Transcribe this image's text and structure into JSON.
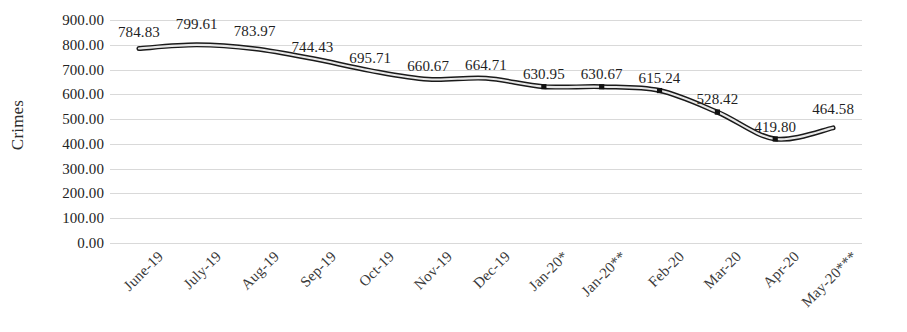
{
  "chart_data": {
    "type": "line",
    "title": "",
    "xlabel": "",
    "ylabel": "Crimes",
    "ylim": [
      0,
      900
    ],
    "ytick_step": 100,
    "grid": true,
    "legend": "none",
    "series_name": "Crimes",
    "line_color": "#595959",
    "line_outline_color": "#1a1a1a",
    "marker": "square",
    "smoothed": true,
    "categories": [
      "June-19",
      "July-19",
      "Aug-19",
      "Sep-19",
      "Oct-19",
      "Nov-19",
      "Dec-19",
      "Jan-20*",
      "Jan-20**",
      "Feb-20",
      "Mar-20",
      "Apr-20",
      "May-20***"
    ],
    "values": [
      784.83,
      799.61,
      783.97,
      744.43,
      695.71,
      660.67,
      664.71,
      630.95,
      630.67,
      615.24,
      528.42,
      419.8,
      464.58
    ],
    "data_labels": [
      "784.83",
      "799.61",
      "783.97",
      "744.43",
      "695.71",
      "660.67",
      "664.71",
      "630.95",
      "630.67",
      "615.24",
      "528.42",
      "419.80",
      "464.58"
    ],
    "ytick_labels": [
      "900.00",
      "800.00",
      "700.00",
      "600.00",
      "500.00",
      "400.00",
      "300.00",
      "200.00",
      "100.00",
      "0.00"
    ],
    "ytick_values": [
      900,
      800,
      700,
      600,
      500,
      400,
      300,
      200,
      100,
      0
    ]
  }
}
